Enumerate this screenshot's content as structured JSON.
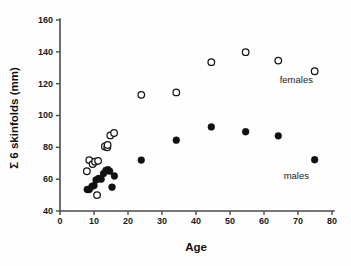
{
  "chart_data": {
    "type": "scatter",
    "title": "",
    "xlabel": "Age",
    "ylabel": "Σ 6 skinfolds (mm)",
    "xlim": [
      0,
      80
    ],
    "ylim": [
      40,
      160
    ],
    "xticks": [
      0,
      10,
      20,
      30,
      40,
      50,
      60,
      70,
      80
    ],
    "yticks": [
      40,
      60,
      80,
      100,
      120,
      140,
      160
    ],
    "grid": false,
    "legend_position": "inline-annotation",
    "series": [
      {
        "name": "females",
        "marker": "open-circle",
        "color": "#111111",
        "label_x": 69.5,
        "label_y": 120.5,
        "points": [
          [
            7.9,
            65.0
          ],
          [
            8.6,
            72.0
          ],
          [
            9.6,
            69.5
          ],
          [
            10.3,
            71.0
          ],
          [
            11.2,
            71.5
          ],
          [
            10.9,
            50.0
          ],
          [
            13.2,
            80.5
          ],
          [
            13.9,
            80.0
          ],
          [
            14.0,
            81.5
          ],
          [
            14.8,
            87.5
          ],
          [
            15.9,
            89.0
          ],
          [
            23.9,
            113.0
          ],
          [
            34.2,
            114.5
          ],
          [
            44.5,
            133.5
          ],
          [
            54.6,
            139.8
          ],
          [
            64.2,
            134.5
          ],
          [
            74.9,
            127.8
          ]
        ]
      },
      {
        "name": "males",
        "marker": "filled-circle",
        "color": "#111111",
        "label_x": 69.5,
        "label_y": 60.0,
        "points": [
          [
            8.0,
            53.5
          ],
          [
            8.6,
            53.5
          ],
          [
            9.4,
            55.5
          ],
          [
            10.0,
            56.0
          ],
          [
            10.6,
            59.5
          ],
          [
            11.4,
            60.5
          ],
          [
            12.1,
            60.0
          ],
          [
            12.8,
            63.5
          ],
          [
            13.5,
            65.5
          ],
          [
            14.1,
            66.0
          ],
          [
            14.6,
            65.0
          ],
          [
            15.3,
            55.0
          ],
          [
            16.0,
            62.0
          ],
          [
            23.9,
            72.0
          ],
          [
            34.2,
            84.5
          ],
          [
            44.5,
            92.8
          ],
          [
            54.6,
            89.8
          ],
          [
            64.2,
            87.2
          ],
          [
            74.9,
            72.2
          ]
        ]
      }
    ]
  }
}
